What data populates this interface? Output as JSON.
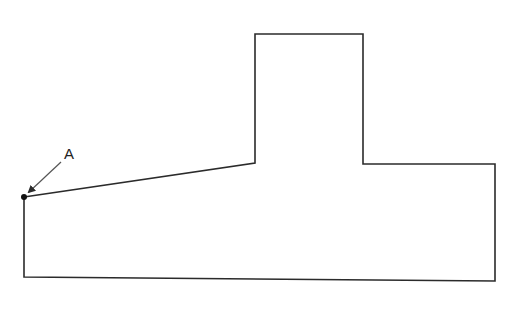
{
  "diagram": {
    "type": "section-outline",
    "stroke_color": "#2b2b2b",
    "background": "#ffffff",
    "outline_points": [
      [
        24,
        197
      ],
      [
        255,
        163
      ],
      [
        255,
        34
      ],
      [
        363,
        34
      ],
      [
        363,
        164
      ],
      [
        495,
        164
      ],
      [
        495,
        281
      ],
      [
        24,
        277
      ]
    ],
    "point_label": {
      "text": "A",
      "label_x": 64,
      "label_y": 159,
      "point_x": 24,
      "point_y": 197,
      "arrow_from": [
        61,
        162
      ],
      "arrow_to": [
        29,
        192
      ]
    }
  }
}
